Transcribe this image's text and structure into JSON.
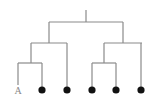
{
  "diagram": {
    "type": "dendrogram",
    "colors": {
      "edge": "#8a8a8a",
      "leaf_dot": "#111111",
      "label": "#888888",
      "background": "#ffffff"
    },
    "root": {
      "x": 86,
      "top_y": 10,
      "bar_y": 22,
      "bar_x1": 49,
      "bar_x2": 123
    },
    "internal_nodes": [
      {
        "id": "left",
        "x": 49,
        "bar_y": 43,
        "bar_x1": 31,
        "bar_x2": 67
      },
      {
        "id": "right",
        "x": 123,
        "bar_y": 43,
        "bar_x1": 104,
        "bar_x2": 142
      },
      {
        "id": "left-inner",
        "x": 31,
        "bar_y": 63,
        "bar_x1": 18,
        "bar_x2": 42
      },
      {
        "id": "right-inner",
        "x": 104,
        "bar_y": 63,
        "bar_x1": 92,
        "bar_x2": 116
      }
    ],
    "leaves": [
      {
        "x": 18,
        "kind": "label",
        "label": "A"
      },
      {
        "x": 42,
        "kind": "dot"
      },
      {
        "x": 67,
        "kind": "dot"
      },
      {
        "x": 92,
        "kind": "dot"
      },
      {
        "x": 116,
        "kind": "dot"
      },
      {
        "x": 141,
        "kind": "dot"
      }
    ],
    "leaf_y": 90
  }
}
